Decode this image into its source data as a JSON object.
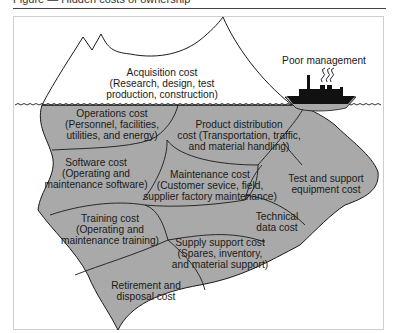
{
  "figure": {
    "caption": "Figure — Hidden costs of ownership"
  },
  "diagram": {
    "type": "iceberg",
    "colors": {
      "underwater_fill": "#a9a9a9",
      "outline": "#1a1a1a",
      "tip_fill": "#ffffff",
      "ship": "#111111"
    },
    "above_water": {
      "label_lines": [
        "Acquisition cost",
        "(Research, design, test",
        "production, construction)"
      ]
    },
    "ship": {
      "label": "Poor management"
    },
    "below_water": [
      {
        "id": "operations",
        "lines": [
          "Operations cost",
          "(Personnel, facilities,",
          "utilities, and energy)"
        ]
      },
      {
        "id": "product_distribution",
        "lines": [
          "Product distribution",
          "cost (Transportation, traffic,",
          "and material handling)"
        ]
      },
      {
        "id": "software",
        "lines": [
          "Software cost",
          "(Operating and",
          "maintenance software)"
        ]
      },
      {
        "id": "maintenance",
        "lines": [
          "Maintenance cost",
          "(Customer sevice, field,",
          "supplier factory maintenance)"
        ]
      },
      {
        "id": "test_support",
        "lines": [
          "Test and support",
          "equipment cost"
        ]
      },
      {
        "id": "technical_data",
        "lines": [
          "Technical",
          "data cost"
        ]
      },
      {
        "id": "training",
        "lines": [
          "Training cost",
          "(Operating and",
          "maintenance training)"
        ]
      },
      {
        "id": "supply_support",
        "lines": [
          "Supply support cost",
          "(Spares, inventory,",
          "and material support)"
        ]
      },
      {
        "id": "retirement",
        "lines": [
          "Retirement and",
          "disposal cost"
        ]
      }
    ]
  }
}
